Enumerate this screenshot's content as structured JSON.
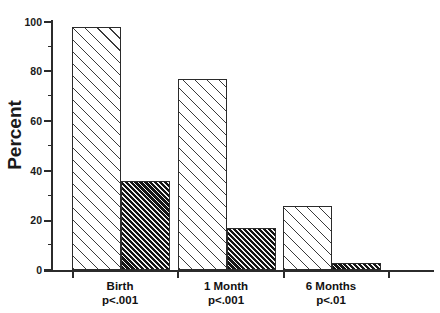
{
  "chart_data": {
    "type": "bar",
    "title": "",
    "subtitle": "",
    "xlabel": "",
    "ylabel": "Percent",
    "ylim": [
      0,
      100
    ],
    "yticks": [
      0,
      20,
      40,
      60,
      80,
      100
    ],
    "ytick_labels": [
      "0",
      "20",
      "40",
      "60",
      "80",
      "100"
    ],
    "minor_tick_step": 10,
    "grid": false,
    "legend": false,
    "legend_position": "none",
    "categories": [
      "Birth",
      "1 Month",
      "6 Months"
    ],
    "annotations": [
      "p<.001",
      "p<.001",
      "p<.01"
    ],
    "series": [
      {
        "name": "series-light",
        "pattern": "sparse-diagonal-hatch",
        "values": [
          98,
          77,
          26
        ]
      },
      {
        "name": "series-dark",
        "pattern": "dense-diagonal-hatch",
        "values": [
          36,
          17,
          3
        ]
      }
    ],
    "colors": {
      "axis": "#2b2b2b",
      "text": "#111111",
      "light_bar_face": "#ffffff",
      "light_bar_hatch": "#3a3a3a",
      "dark_bar_face": "#f2f2f2",
      "dark_bar_hatch": "#141414",
      "background": "#ffffff"
    }
  },
  "axis": {
    "y_title": "Percent",
    "tick_100": "100",
    "tick_80": "80",
    "tick_60": "60",
    "tick_40": "40",
    "tick_20": "20",
    "tick_0": "0"
  },
  "groups": [
    {
      "name": "Birth",
      "pvalue": "p<.001"
    },
    {
      "name": "1 Month",
      "pvalue": "p<.001"
    },
    {
      "name": "6 Months",
      "pvalue": "p<.01"
    }
  ]
}
